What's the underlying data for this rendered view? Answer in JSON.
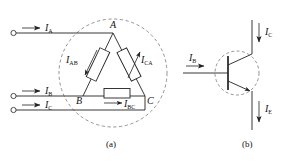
{
  "figure": {
    "caption_a": "(a)",
    "caption_b": "(b)",
    "background": "#ffffff",
    "ink": "#222222",
    "dash": "#555555"
  },
  "panel_a": {
    "name": "delta-connected-three-phase-load",
    "line_currents": [
      {
        "id": "IA",
        "symbol": "I",
        "subscript": "A",
        "label": "I_A"
      },
      {
        "id": "IB",
        "symbol": "I",
        "subscript": "B",
        "label": "I_B"
      },
      {
        "id": "IC",
        "symbol": "I",
        "subscript": "C",
        "label": "I_C"
      }
    ],
    "nodes": [
      {
        "id": "A",
        "label": "A"
      },
      {
        "id": "B",
        "label": "B"
      },
      {
        "id": "C",
        "label": "C"
      }
    ],
    "phase_currents": [
      {
        "id": "IAB",
        "symbol": "I",
        "subscript": "AB",
        "label": "I_AB"
      },
      {
        "id": "ICA",
        "symbol": "I",
        "subscript": "CA",
        "label": "I_CA"
      },
      {
        "id": "IBC",
        "symbol": "I",
        "subscript": "BC",
        "label": "I_BC"
      }
    ],
    "elements": [
      "resistor-ab",
      "resistor-ca",
      "resistor-bc"
    ],
    "boundary": "dashed-circle"
  },
  "panel_b": {
    "name": "npn-bipolar-transistor",
    "terminals": [
      {
        "id": "IB",
        "symbol": "I",
        "subscript": "B",
        "label": "I_B",
        "direction": "right"
      },
      {
        "id": "IC",
        "symbol": "I",
        "subscript": "C",
        "label": "I_C",
        "direction": "down"
      },
      {
        "id": "IE",
        "symbol": "I",
        "subscript": "E",
        "label": "I_E",
        "direction": "down"
      }
    ],
    "boundary": "dashed-circle"
  }
}
